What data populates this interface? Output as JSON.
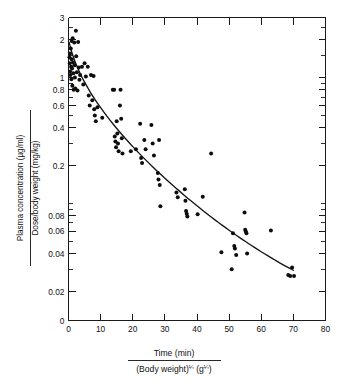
{
  "figure": {
    "kind": "scatter-with-fitted-curve",
    "background": "#ffffff",
    "ink_color": "#111111"
  },
  "chart_data": {
    "type": "scatter",
    "title": "",
    "subtitle": "",
    "xlabel_numerator": "Time (min)",
    "xlabel_denominator_prefix": "(Body weight)",
    "xlabel_denominator_exp": "¼",
    "xlabel_denominator_mid": " (g",
    "xlabel_denominator_exp2": "¼",
    "xlabel_denominator_suffix": ")",
    "ylabel_numerator": "Plasma concentration  (µg/ml)",
    "ylabel_denominator": "Dose/body weight  (mg/kg)",
    "xscale": "linear",
    "yscale": "log",
    "xlim": [
      0,
      80
    ],
    "ylim": [
      0.02,
      3
    ],
    "grid": false,
    "legend": null,
    "xticks": [
      0,
      10,
      20,
      30,
      40,
      50,
      60,
      70,
      80
    ],
    "xticklabels": [
      "0",
      "10",
      "20",
      "30",
      "40",
      "50",
      "60",
      "70",
      "80"
    ],
    "yticks_labeled": [
      0.02,
      0.04,
      0.06,
      0.08,
      0.2,
      0.4,
      0.6,
      0.8,
      1,
      2,
      3
    ],
    "yticklabels": [
      "0.02",
      "0.04",
      "0.06",
      "0.08",
      "0.2",
      "0.4",
      "0.6",
      "0.8",
      "1",
      "2",
      "3"
    ],
    "y_zero_label": "0",
    "yticks_minor": [
      0.03,
      0.05,
      0.07,
      0.09,
      0.1,
      0.3,
      0.5,
      0.7,
      0.9,
      1.5,
      2.5
    ],
    "series": [
      {
        "name": "observations",
        "marker": "filled-circle",
        "color": "#0d0d0d",
        "points": [
          [
            0.3,
            1.45
          ],
          [
            0.4,
            1.3
          ],
          [
            0.5,
            1.55
          ],
          [
            0.5,
            1.12
          ],
          [
            0.6,
            1.05
          ],
          [
            0.7,
            1.7
          ],
          [
            0.8,
            1.22
          ],
          [
            0.9,
            0.97
          ],
          [
            1.0,
            1.95
          ],
          [
            1.0,
            1.4
          ],
          [
            1.1,
            1.18
          ],
          [
            1.2,
            0.86
          ],
          [
            1.3,
            2.05
          ],
          [
            1.4,
            1.32
          ],
          [
            1.5,
            1.08
          ],
          [
            1.6,
            0.8
          ],
          [
            1.8,
            1.9
          ],
          [
            1.9,
            1.25
          ],
          [
            2.0,
            1.0
          ],
          [
            2.1,
            0.82
          ],
          [
            2.3,
            2.35
          ],
          [
            2.4,
            1.48
          ],
          [
            2.6,
            1.1
          ],
          [
            2.8,
            0.79
          ],
          [
            3.0,
            1.92
          ],
          [
            3.2,
            1.2
          ],
          [
            3.4,
            0.96
          ],
          [
            3.6,
            1.05
          ],
          [
            4.2,
            1.22
          ],
          [
            4.6,
            0.88
          ],
          [
            5.0,
            1.3
          ],
          [
            5.4,
            1.02
          ],
          [
            6.0,
            1.22
          ],
          [
            6.3,
            0.72
          ],
          [
            6.6,
            0.6
          ],
          [
            7.0,
            1.05
          ],
          [
            7.4,
            0.66
          ],
          [
            7.8,
            1.03
          ],
          [
            8.0,
            0.56
          ],
          [
            8.2,
            0.5
          ],
          [
            8.5,
            0.45
          ],
          [
            9.0,
            0.58
          ],
          [
            10.5,
            0.48
          ],
          [
            13.8,
            0.8
          ],
          [
            14.2,
            0.8
          ],
          [
            14.4,
            0.34
          ],
          [
            14.6,
            0.31
          ],
          [
            14.8,
            0.28
          ],
          [
            15.0,
            0.45
          ],
          [
            15.2,
            0.36
          ],
          [
            15.4,
            0.3
          ],
          [
            15.6,
            0.26
          ],
          [
            16.0,
            0.6
          ],
          [
            16.2,
            0.8
          ],
          [
            16.4,
            0.47
          ],
          [
            16.6,
            0.33
          ],
          [
            16.8,
            0.25
          ],
          [
            19.4,
            0.26
          ],
          [
            21.0,
            0.27
          ],
          [
            22.3,
            0.43
          ],
          [
            22.6,
            0.23
          ],
          [
            22.9,
            0.21
          ],
          [
            23.6,
            0.32
          ],
          [
            24.0,
            0.27
          ],
          [
            25.8,
            0.42
          ],
          [
            26.2,
            0.3
          ],
          [
            26.6,
            0.24
          ],
          [
            27.8,
            0.175
          ],
          [
            28.0,
            0.155
          ],
          [
            28.2,
            0.32
          ],
          [
            28.4,
            0.14
          ],
          [
            28.6,
            0.095
          ],
          [
            33.6,
            0.122
          ],
          [
            34.0,
            0.112
          ],
          [
            36.2,
            0.13
          ],
          [
            36.4,
            0.105
          ],
          [
            36.6,
            0.087
          ],
          [
            36.8,
            0.083
          ],
          [
            37.0,
            0.079
          ],
          [
            40.2,
            0.082
          ],
          [
            41.8,
            0.113
          ],
          [
            44.4,
            0.25
          ],
          [
            47.6,
            0.041
          ],
          [
            50.8,
            0.03
          ],
          [
            51.2,
            0.058
          ],
          [
            51.6,
            0.046
          ],
          [
            51.8,
            0.044
          ],
          [
            52.2,
            0.039
          ],
          [
            54.8,
            0.085
          ],
          [
            55.0,
            0.062
          ],
          [
            55.2,
            0.06
          ],
          [
            55.4,
            0.058
          ],
          [
            55.6,
            0.04
          ],
          [
            63.0,
            0.061
          ],
          [
            68.4,
            0.027
          ],
          [
            69.0,
            0.0265
          ],
          [
            69.6,
            0.031
          ],
          [
            70.2,
            0.0265
          ]
        ]
      }
    ],
    "fit_curve": {
      "name": "fitted-decay-curve",
      "color": "#151515",
      "points": [
        [
          0.2,
          1.9
        ],
        [
          1.0,
          1.6
        ],
        [
          2.0,
          1.35
        ],
        [
          3.0,
          1.17
        ],
        [
          4.0,
          1.03
        ],
        [
          5.0,
          0.92
        ],
        [
          6.0,
          0.83
        ],
        [
          7.0,
          0.75
        ],
        [
          8.0,
          0.685
        ],
        [
          9.0,
          0.628
        ],
        [
          10.0,
          0.578
        ],
        [
          12.0,
          0.492
        ],
        [
          14.0,
          0.424
        ],
        [
          16.0,
          0.368
        ],
        [
          18.0,
          0.322
        ],
        [
          20.0,
          0.283
        ],
        [
          22.0,
          0.25
        ],
        [
          24.0,
          0.222
        ],
        [
          26.0,
          0.198
        ],
        [
          28.0,
          0.177
        ],
        [
          30.0,
          0.159
        ],
        [
          32.0,
          0.143
        ],
        [
          34.0,
          0.129
        ],
        [
          36.0,
          0.1165
        ],
        [
          38.0,
          0.1055
        ],
        [
          40.0,
          0.0958
        ],
        [
          42.0,
          0.0872
        ],
        [
          44.0,
          0.0796
        ],
        [
          46.0,
          0.0728
        ],
        [
          48.0,
          0.0667
        ],
        [
          50.0,
          0.0613
        ],
        [
          52.0,
          0.0564
        ],
        [
          54.0,
          0.0521
        ],
        [
          56.0,
          0.0481
        ],
        [
          58.0,
          0.0446
        ],
        [
          60.0,
          0.0414
        ],
        [
          62.0,
          0.0385
        ],
        [
          64.0,
          0.0359
        ],
        [
          66.0,
          0.0335
        ],
        [
          68.0,
          0.0314
        ],
        [
          70.0,
          0.0295
        ]
      ]
    }
  }
}
